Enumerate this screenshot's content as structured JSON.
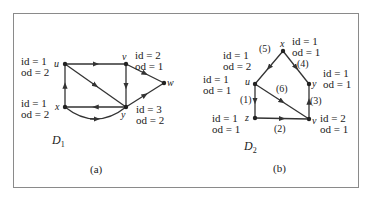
{
  "figure": {
    "panels": [
      {
        "caption": "(a)",
        "graph_name": "D",
        "graph_subscript": "1",
        "nodes": [
          {
            "id": "u",
            "label": "u",
            "degree": [
              "id = 1",
              "od = 2"
            ]
          },
          {
            "id": "v",
            "label": "v",
            "degree": [
              "id = 2",
              "od = 1"
            ]
          },
          {
            "id": "w",
            "label": "w",
            "degree": []
          },
          {
            "id": "x",
            "label": "x",
            "degree": [
              "id = 1",
              "od = 2"
            ]
          },
          {
            "id": "y",
            "label": "y",
            "degree": [
              "id = 3",
              "od = 2"
            ]
          }
        ],
        "edges": [
          {
            "from": "u",
            "to": "v"
          },
          {
            "from": "u",
            "to": "y"
          },
          {
            "from": "v",
            "to": "y"
          },
          {
            "from": "v",
            "to": "w"
          },
          {
            "from": "y",
            "to": "w"
          },
          {
            "from": "y",
            "to": "x"
          },
          {
            "from": "x",
            "to": "y",
            "curved": true
          },
          {
            "from": "x",
            "to": "u"
          }
        ]
      },
      {
        "caption": "(b)",
        "graph_name": "D",
        "graph_subscript": "2",
        "nodes": [
          {
            "id": "x",
            "label": "x",
            "degree": [
              "id = 1",
              "od = 1"
            ]
          },
          {
            "id": "u",
            "label": "u",
            "degree": [
              "id = 1",
              "od = 2"
            ]
          },
          {
            "id": "y",
            "label": "y",
            "degree": [
              "id = 1",
              "od = 1"
            ]
          },
          {
            "id": "z",
            "label": "z",
            "degree": [
              "id = 1",
              "od = 1"
            ]
          },
          {
            "id": "v",
            "label": "v",
            "degree": [
              "id = 2",
              "od = 1"
            ]
          }
        ],
        "extra_degree_labels": [
          [
            "id = 1",
            "od = 1"
          ]
        ],
        "edges": [
          {
            "from": "x",
            "to": "u",
            "label": "(5)"
          },
          {
            "from": "x",
            "to": "y",
            "label": "(4)"
          },
          {
            "from": "u",
            "to": "z",
            "label": "(1)"
          },
          {
            "from": "u",
            "to": "v",
            "label": "(6)"
          },
          {
            "from": "z",
            "to": "v",
            "label": "(2)"
          },
          {
            "from": "v",
            "to": "y",
            "label": "(3)"
          }
        ]
      }
    ]
  }
}
